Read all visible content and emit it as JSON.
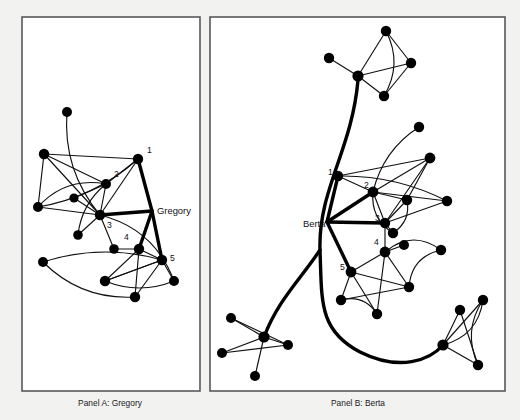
{
  "figure": {
    "background_color": "#f2f2f0",
    "panel_fill": "#ffffff",
    "panel_stroke": "#58585a",
    "node_color": "#000000",
    "edge_color": "#111111"
  },
  "panels": [
    {
      "id": "panel-a",
      "caption": "Panel A: Gregory",
      "caption_x": 110,
      "caption_y": 406,
      "frame": {
        "x": 22,
        "y": 17,
        "width": 178,
        "height": 374
      },
      "ego": {
        "label": "Berta",
        "name": "Gregory",
        "label_x": 157,
        "label_y": 214,
        "anchor_x": 152,
        "anchor_y": 211
      },
      "numbered": [
        {
          "n": "1",
          "x": 147,
          "y": 153
        },
        {
          "n": "2",
          "x": 114,
          "y": 177
        },
        {
          "n": "3",
          "x": 107,
          "y": 228
        },
        {
          "n": "4",
          "x": 124,
          "y": 240
        },
        {
          "n": "5",
          "x": 170,
          "y": 261
        }
      ],
      "nodes": [
        {
          "id": "a0",
          "x": 138,
          "y": 159,
          "r": 5.2
        },
        {
          "id": "a1",
          "x": 106,
          "y": 184,
          "r": 5.0
        },
        {
          "id": "a2",
          "x": 100,
          "y": 215,
          "r": 5.2
        },
        {
          "id": "a3",
          "x": 139,
          "y": 249,
          "r": 5.2
        },
        {
          "id": "a4",
          "x": 162,
          "y": 260,
          "r": 5.2
        },
        {
          "id": "a5",
          "x": 67,
          "y": 112,
          "r": 5.0
        },
        {
          "id": "a6",
          "x": 44,
          "y": 154,
          "r": 5.2
        },
        {
          "id": "a7",
          "x": 74,
          "y": 198,
          "r": 4.6
        },
        {
          "id": "a8",
          "x": 38,
          "y": 207,
          "r": 5.0
        },
        {
          "id": "a9",
          "x": 78,
          "y": 235,
          "r": 4.8
        },
        {
          "id": "a10",
          "x": 114,
          "y": 249,
          "r": 4.8
        },
        {
          "id": "a11",
          "x": 43,
          "y": 262,
          "r": 5.0
        },
        {
          "id": "a12",
          "x": 105,
          "y": 281,
          "r": 5.2
        },
        {
          "id": "a13",
          "x": 135,
          "y": 297,
          "r": 5.2
        },
        {
          "id": "a14",
          "x": 174,
          "y": 281,
          "r": 5.0
        }
      ],
      "edges": [
        {
          "from": "a6",
          "to": "a0",
          "curve": 0
        },
        {
          "from": "a6",
          "to": "a1",
          "curve": 0
        },
        {
          "from": "a6",
          "to": "a8",
          "curve": 0
        },
        {
          "from": "a6",
          "to": "a2",
          "curve": 0
        },
        {
          "from": "a0",
          "to": "a1",
          "curve": 0
        },
        {
          "from": "a0",
          "to": "a2",
          "curve": 0
        },
        {
          "from": "a0",
          "to": "a8",
          "curve": -16
        },
        {
          "from": "a1",
          "to": "a2",
          "curve": 0
        },
        {
          "from": "a1",
          "to": "a7",
          "curve": 0
        },
        {
          "from": "a1",
          "to": "a9",
          "curve": 12
        },
        {
          "from": "a2",
          "to": "a7",
          "curve": 0
        },
        {
          "from": "a2",
          "to": "a8",
          "curve": 0
        },
        {
          "from": "a2",
          "to": "a9",
          "curve": 0
        },
        {
          "from": "a2",
          "to": "a10",
          "curve": 0
        },
        {
          "from": "a8",
          "to": "a1",
          "curve": -20
        },
        {
          "from": "a5",
          "to": "a2",
          "curve": 22
        },
        {
          "from": "a2",
          "to": "a14",
          "curve": -26
        },
        {
          "from": "a3",
          "to": "a4",
          "curve": 0
        },
        {
          "from": "a3",
          "to": "a10",
          "curve": 0
        },
        {
          "from": "a3",
          "to": "a12",
          "curve": 0
        },
        {
          "from": "a3",
          "to": "a13",
          "curve": 0
        },
        {
          "from": "a4",
          "to": "a12",
          "curve": 0
        },
        {
          "from": "a4",
          "to": "a13",
          "curve": 0
        },
        {
          "from": "a4",
          "to": "a14",
          "curve": 0
        },
        {
          "from": "a4",
          "to": "a11",
          "curve": 18
        },
        {
          "from": "a12",
          "to": "a14",
          "curve": 14
        },
        {
          "from": "a11",
          "to": "a13",
          "curve": 22
        },
        {
          "from": "a12",
          "to": "a4",
          "curve": 0
        }
      ],
      "ego_edges": [
        {
          "to": "a0"
        },
        {
          "to": "a2"
        },
        {
          "to": "a4"
        },
        {
          "to": "a3"
        }
      ]
    },
    {
      "id": "panel-b",
      "caption": "Panel B: Berta",
      "caption_x": 358,
      "caption_y": 406,
      "frame": {
        "x": 210,
        "y": 17,
        "width": 295,
        "height": 374
      },
      "ego": {
        "name": "Berta",
        "label_x": 303,
        "label_y": 227,
        "anchor_x": 327,
        "anchor_y": 222
      },
      "numbered": [
        {
          "n": "1",
          "x": 328,
          "y": 175
        },
        {
          "n": "2",
          "x": 364,
          "y": 188
        },
        {
          "n": "3",
          "x": 375,
          "y": 221
        },
        {
          "n": "4",
          "x": 374,
          "y": 245
        },
        {
          "n": "5",
          "x": 340,
          "y": 270
        }
      ],
      "nodes": [
        {
          "id": "b1",
          "x": 338,
          "y": 176,
          "r": 5.2
        },
        {
          "id": "b2",
          "x": 373,
          "y": 192,
          "r": 5.4
        },
        {
          "id": "b3",
          "x": 385,
          "y": 223,
          "r": 5.2
        },
        {
          "id": "b4",
          "x": 385,
          "y": 252,
          "r": 5.4
        },
        {
          "id": "b5",
          "x": 351,
          "y": 272,
          "r": 5.4
        },
        {
          "id": "b6",
          "x": 386,
          "y": 31,
          "r": 5.2
        },
        {
          "id": "b7",
          "x": 358,
          "y": 76,
          "r": 5.6
        },
        {
          "id": "b8",
          "x": 329,
          "y": 58,
          "r": 5.2
        },
        {
          "id": "b9",
          "x": 411,
          "y": 63,
          "r": 5.2
        },
        {
          "id": "b10",
          "x": 384,
          "y": 96,
          "r": 5.2
        },
        {
          "id": "b11",
          "x": 419,
          "y": 127,
          "r": 5.2
        },
        {
          "id": "b12",
          "x": 430,
          "y": 158,
          "r": 5.4
        },
        {
          "id": "b13",
          "x": 407,
          "y": 200,
          "r": 5.2
        },
        {
          "id": "b14",
          "x": 447,
          "y": 201,
          "r": 5.2
        },
        {
          "id": "b15",
          "x": 393,
          "y": 233,
          "r": 5.2
        },
        {
          "id": "b16",
          "x": 404,
          "y": 245,
          "r": 5.0
        },
        {
          "id": "b17",
          "x": 441,
          "y": 250,
          "r": 5.2
        },
        {
          "id": "b18",
          "x": 409,
          "y": 287,
          "r": 5.2
        },
        {
          "id": "b19",
          "x": 341,
          "y": 300,
          "r": 5.2
        },
        {
          "id": "b20",
          "x": 377,
          "y": 314,
          "r": 5.2
        },
        {
          "id": "b21",
          "x": 264,
          "y": 337,
          "r": 5.6
        },
        {
          "id": "b22",
          "x": 231,
          "y": 318,
          "r": 5.0
        },
        {
          "id": "b23",
          "x": 222,
          "y": 353,
          "r": 5.0
        },
        {
          "id": "b24",
          "x": 288,
          "y": 345,
          "r": 5.0
        },
        {
          "id": "b25",
          "x": 255,
          "y": 376,
          "r": 5.0
        },
        {
          "id": "b26",
          "x": 443,
          "y": 345,
          "r": 5.6
        },
        {
          "id": "b27",
          "x": 460,
          "y": 310,
          "r": 5.2
        },
        {
          "id": "b28",
          "x": 483,
          "y": 300,
          "r": 5.2
        },
        {
          "id": "b29",
          "x": 478,
          "y": 365,
          "r": 5.2
        }
      ],
      "edges": [
        {
          "from": "b7",
          "to": "b6",
          "curve": 0
        },
        {
          "from": "b7",
          "to": "b8",
          "curve": 0
        },
        {
          "from": "b7",
          "to": "b9",
          "curve": 0
        },
        {
          "from": "b7",
          "to": "b10",
          "curve": 0
        },
        {
          "from": "b6",
          "to": "b9",
          "curve": 0
        },
        {
          "from": "b6",
          "to": "b10",
          "curve": -18
        },
        {
          "from": "b9",
          "to": "b10",
          "curve": 0
        },
        {
          "from": "b1",
          "to": "b12",
          "curve": 0
        },
        {
          "from": "b1",
          "to": "b2",
          "curve": 0
        },
        {
          "from": "b1",
          "to": "b14",
          "curve": -14
        },
        {
          "from": "b2",
          "to": "b12",
          "curve": 0
        },
        {
          "from": "b2",
          "to": "b13",
          "curve": 0
        },
        {
          "from": "b2",
          "to": "b14",
          "curve": 0
        },
        {
          "from": "b2",
          "to": "b3",
          "curve": 0
        },
        {
          "from": "b2",
          "to": "b15",
          "curve": 14
        },
        {
          "from": "b12",
          "to": "b3",
          "curve": 0
        },
        {
          "from": "b12",
          "to": "b13",
          "curve": 0
        },
        {
          "from": "b3",
          "to": "b13",
          "curve": 0
        },
        {
          "from": "b3",
          "to": "b15",
          "curve": 0
        },
        {
          "from": "b3",
          "to": "b14",
          "curve": 0
        },
        {
          "from": "b13",
          "to": "b15",
          "curve": -12
        },
        {
          "from": "b11",
          "to": "b2",
          "curve": 16
        },
        {
          "from": "b3",
          "to": "b4",
          "curve": 0
        },
        {
          "from": "b4",
          "to": "b5",
          "curve": 0
        },
        {
          "from": "b4",
          "to": "b16",
          "curve": 0
        },
        {
          "from": "b4",
          "to": "b18",
          "curve": 0
        },
        {
          "from": "b4",
          "to": "b20",
          "curve": 0
        },
        {
          "from": "b5",
          "to": "b18",
          "curve": 0
        },
        {
          "from": "b5",
          "to": "b19",
          "curve": 0
        },
        {
          "from": "b5",
          "to": "b20",
          "curve": 0
        },
        {
          "from": "b19",
          "to": "b18",
          "curve": 0
        },
        {
          "from": "b19",
          "to": "b20",
          "curve": -14
        },
        {
          "from": "b17",
          "to": "b18",
          "curve": 18
        },
        {
          "from": "b17",
          "to": "b4",
          "curve": 22
        },
        {
          "from": "b21",
          "to": "b22",
          "curve": 0
        },
        {
          "from": "b21",
          "to": "b23",
          "curve": 0
        },
        {
          "from": "b21",
          "to": "b24",
          "curve": 0
        },
        {
          "from": "b21",
          "to": "b25",
          "curve": 0
        },
        {
          "from": "b23",
          "to": "b24",
          "curve": 0
        },
        {
          "from": "b22",
          "to": "b24",
          "curve": 0
        },
        {
          "from": "b26",
          "to": "b27",
          "curve": 0
        },
        {
          "from": "b26",
          "to": "b28",
          "curve": 0
        },
        {
          "from": "b26",
          "to": "b29",
          "curve": 0
        },
        {
          "from": "b27",
          "to": "b29",
          "curve": 0
        },
        {
          "from": "b28",
          "to": "b26",
          "curve": -20
        },
        {
          "from": "b28",
          "to": "b29",
          "curve": 18
        }
      ],
      "ego_edges": [
        {
          "to": "b1"
        },
        {
          "to": "b2"
        },
        {
          "to": "b3"
        },
        {
          "to": "b5"
        }
      ],
      "trunk_note": "thick spine from top cluster down and right to bottom-right cluster"
    }
  ]
}
